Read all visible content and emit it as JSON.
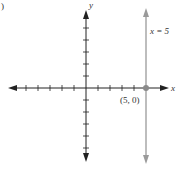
{
  "figure": {
    "panel_label": ")",
    "axes": {
      "x_label": "x",
      "y_label": "y",
      "x_ticks_left": 5,
      "x_ticks_right": 4,
      "y_ticks_up": 5,
      "y_ticks_down": 5,
      "axis_color": "#222222"
    },
    "line": {
      "equation_label": "x = 5",
      "x_value": 5,
      "color": "#9a9a9a"
    },
    "point": {
      "label": "(5, 0)",
      "x": 5,
      "y": 0,
      "color": "#8a8a8a"
    }
  }
}
